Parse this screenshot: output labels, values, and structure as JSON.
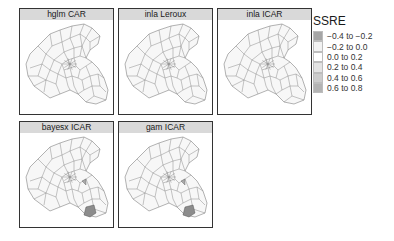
{
  "chart_data": {
    "type": "heatmap",
    "subtype": "faceted choropleth map",
    "title": "",
    "legend": {
      "title": "SSRE",
      "position": "right",
      "items": [
        {
          "label": "−0.4 to −0.2",
          "color": "#a6a6a6"
        },
        {
          "label": "−0.2 to 0.0",
          "color": "#f2f2f2"
        },
        {
          "label": "0.0 to 0.2",
          "color": "#ffffff"
        },
        {
          "label": "0.2 to 0.4",
          "color": "#e3e3e3"
        },
        {
          "label": "0.4 to 0.6",
          "color": "#cccccc"
        },
        {
          "label": "0.6 to 0.8",
          "color": "#b3b3b3"
        }
      ]
    },
    "panels": [
      {
        "title": "hglm CAR",
        "highlighted_regions": []
      },
      {
        "title": "inla Leroux",
        "highlighted_regions": []
      },
      {
        "title": "inla ICAR",
        "highlighted_regions": []
      },
      {
        "title": "bayesx ICAR",
        "highlighted_regions": [
          {
            "location": "south-east",
            "class": "−0.4 to −0.2"
          }
        ]
      },
      {
        "title": "gam ICAR",
        "highlighted_regions": [
          {
            "location": "south-east",
            "class": "−0.4 to −0.2"
          }
        ]
      }
    ],
    "default_region_class": "0.0 to 0.2"
  },
  "colors": {
    "strip_bg": "#d9d9d9",
    "border": "#333333",
    "region_fill": "#f7f7f7",
    "region_stroke": "#7f7f7f",
    "highlight_fill": "#8c8c8c"
  }
}
